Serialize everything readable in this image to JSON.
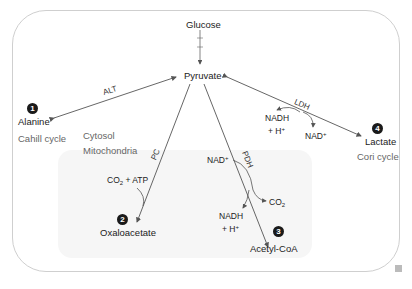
{
  "diagram": {
    "compartments": {
      "cytosol": "Cytosol",
      "mitochondria": "Mitochondria"
    },
    "nodes": {
      "glucose": "Glucose",
      "pyruvate": "Pyruvate",
      "alanine": "Alanine",
      "oxaloacetate": "Oxaloacetate",
      "acetyl_coa": "Acetyl-CoA",
      "lactate": "Lactate"
    },
    "numbers": {
      "alanine": "1",
      "oxaloacetate": "2",
      "acetyl_coa": "3",
      "lactate": "4"
    },
    "cycles": {
      "alanine": "Cahill cycle",
      "lactate": "Cori cycle"
    },
    "enzymes": {
      "alt": "ALT",
      "pc": "PC",
      "pdh": "PDH",
      "ldh": "LDH"
    },
    "cofactors": {
      "pc_co2": "CO",
      "pc_co2_sub": "2",
      "pc_atp": " + ATP",
      "pdh_nad": "NAD",
      "pdh_nad_sup": "+",
      "pdh_co2": "CO",
      "pdh_co2_sub": "2",
      "pdh_nadh": "NADH",
      "pdh_h": "+ H",
      "pdh_h_sup": "+",
      "ldh_nadh": "NADH",
      "ldh_h": "+ H",
      "ldh_h_sup": "+",
      "ldh_nad": "NAD",
      "ldh_nad_sup": "+"
    },
    "colors": {
      "line": "#555555",
      "frame": "#cfcfcf",
      "mito_fill": "#f6f6f6"
    }
  }
}
